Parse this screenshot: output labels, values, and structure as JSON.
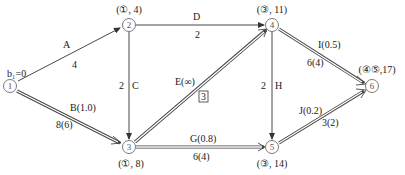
{
  "diagram": {
    "title": "",
    "start_label": "b₁=0",
    "nodes": [
      {
        "id": "1",
        "label": "1",
        "x": 10,
        "y": 86,
        "annotation": ""
      },
      {
        "id": "2",
        "label": "2",
        "x": 129,
        "y": 25,
        "annotation": "(①, 4)"
      },
      {
        "id": "3",
        "label": "3",
        "x": 129,
        "y": 147,
        "annotation": "(①, 8)"
      },
      {
        "id": "4",
        "label": "4",
        "x": 272,
        "y": 25,
        "annotation": "(③, 11)"
      },
      {
        "id": "5",
        "label": "5",
        "x": 272,
        "y": 147,
        "annotation": "(③, 14)"
      },
      {
        "id": "6",
        "label": "6",
        "x": 372,
        "y": 86,
        "annotation": "(④⑤,17)"
      }
    ],
    "edges": [
      {
        "id": "A",
        "from": "1",
        "to": "2",
        "name": "A",
        "value": "4",
        "double": false
      },
      {
        "id": "B",
        "from": "1",
        "to": "3",
        "name": "B(1.0)",
        "value": "8(6)",
        "double": true
      },
      {
        "id": "C",
        "from": "2",
        "to": "3",
        "name": "C",
        "value": "2",
        "double": false
      },
      {
        "id": "D",
        "from": "2",
        "to": "4",
        "name": "D",
        "value": "2",
        "double": false
      },
      {
        "id": "E",
        "from": "3",
        "to": "4",
        "name": "E(∞)",
        "value": "3",
        "double": true,
        "boxed_value": true
      },
      {
        "id": "G",
        "from": "3",
        "to": "5",
        "name": "G(0.8)",
        "value": "6(4)",
        "double": true
      },
      {
        "id": "H",
        "from": "4",
        "to": "5",
        "name": "H",
        "value": "2",
        "double": false
      },
      {
        "id": "I",
        "from": "4",
        "to": "6",
        "name": "I(0.5)",
        "value": "6(4)",
        "double": true
      },
      {
        "id": "J",
        "from": "5",
        "to": "6",
        "name": "J(0.2)",
        "value": "3(2)",
        "double": true
      }
    ]
  }
}
